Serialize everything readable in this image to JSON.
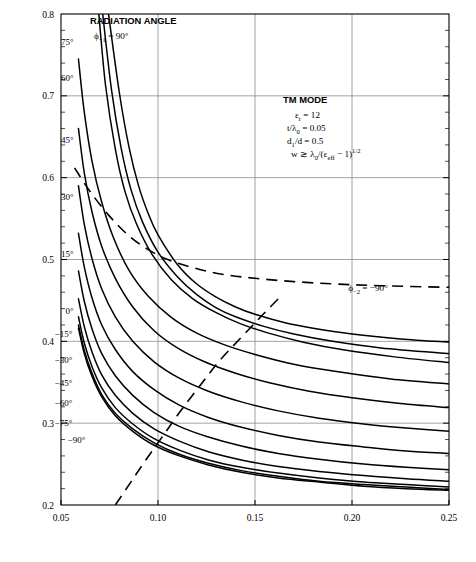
{
  "figure": {
    "background": "#ffffff",
    "frame_color": "#000000",
    "grid_color": "#8c8c8c",
    "curve_color": "#000000"
  },
  "chart_data": {
    "type": "line",
    "title": "",
    "xlabel": "ANTENNA HEIGHT (h/λ₀)—WAVELENGTHS",
    "ylabel": "CORRUGATION PERIOD (d/λ₀)—WAVELENGTHS",
    "xlim": [
      0.05,
      0.25
    ],
    "ylim": [
      0.2,
      0.8
    ],
    "xticks": [
      0.05,
      0.1,
      0.15,
      0.2,
      0.25
    ],
    "xtick_labels": [
      "0.05",
      "0.10",
      "0.15",
      "0.20",
      "0.25"
    ],
    "yticks": [
      0.2,
      0.3,
      0.4,
      0.5,
      0.6,
      0.7,
      0.8
    ],
    "ytick_labels": [
      "0.2",
      "0.3",
      "0.4",
      "0.5",
      "0.6",
      "0.7",
      "0.8"
    ],
    "y_minor_step": 0.02,
    "grid": true,
    "grid_major_only": true,
    "legend_position": "inline-curve-labels",
    "annotations": {
      "header": "RADIATION ANGLE",
      "header_sub": "ϕ₋₁ = 90°",
      "mode_title": "TM MODE",
      "params": [
        "εᵣ = 12",
        "t/λ₀ = 0.05",
        "d₁/d = 0.5",
        "w ≳ λ₀/(ε_eff − 1)^(1/2)"
      ],
      "dashed_curve_label": "ϕ₋₂ = −90°"
    },
    "series": [
      {
        "name": "75°",
        "label": "75°",
        "style": "solid",
        "label_xy": [
          0.0565,
          0.762
        ],
        "points": [
          [
            0.0745,
            0.8
          ],
          [
            0.08,
            0.705
          ],
          [
            0.085,
            0.638
          ],
          [
            0.09,
            0.59
          ],
          [
            0.095,
            0.556
          ],
          [
            0.1,
            0.53
          ],
          [
            0.11,
            0.494
          ],
          [
            0.12,
            0.47
          ],
          [
            0.13,
            0.454
          ],
          [
            0.14,
            0.442
          ],
          [
            0.15,
            0.433
          ],
          [
            0.165,
            0.423
          ],
          [
            0.18,
            0.416
          ],
          [
            0.2,
            0.409
          ],
          [
            0.225,
            0.403
          ],
          [
            0.25,
            0.399
          ]
        ]
      },
      {
        "name": "60°",
        "label": "60°",
        "style": "solid",
        "label_xy": [
          0.0565,
          0.718
        ],
        "points": [
          [
            0.0715,
            0.8
          ],
          [
            0.076,
            0.708
          ],
          [
            0.081,
            0.636
          ],
          [
            0.086,
            0.586
          ],
          [
            0.092,
            0.546
          ],
          [
            0.1,
            0.509
          ],
          [
            0.11,
            0.479
          ],
          [
            0.12,
            0.457
          ],
          [
            0.13,
            0.441
          ],
          [
            0.14,
            0.43
          ],
          [
            0.155,
            0.418
          ],
          [
            0.17,
            0.409
          ],
          [
            0.19,
            0.4
          ],
          [
            0.215,
            0.392
          ],
          [
            0.25,
            0.385
          ]
        ]
      },
      {
        "name": "45°",
        "label": "45°",
        "style": "solid",
        "label_xy": [
          0.0565,
          0.642
        ],
        "points": [
          [
            0.0695,
            0.8
          ],
          [
            0.073,
            0.712
          ],
          [
            0.078,
            0.635
          ],
          [
            0.083,
            0.583
          ],
          [
            0.089,
            0.543
          ],
          [
            0.097,
            0.506
          ],
          [
            0.107,
            0.475
          ],
          [
            0.118,
            0.452
          ],
          [
            0.13,
            0.435
          ],
          [
            0.142,
            0.422
          ],
          [
            0.157,
            0.41
          ],
          [
            0.175,
            0.399
          ],
          [
            0.197,
            0.389
          ],
          [
            0.222,
            0.381
          ],
          [
            0.25,
            0.374
          ]
        ]
      },
      {
        "name": "30°",
        "label": "30°",
        "style": "solid",
        "label_xy": [
          0.0565,
          0.573
        ],
        "points": [
          [
            0.059,
            0.745
          ],
          [
            0.062,
            0.68
          ],
          [
            0.066,
            0.62
          ],
          [
            0.071,
            0.57
          ],
          [
            0.077,
            0.527
          ],
          [
            0.085,
            0.487
          ],
          [
            0.095,
            0.455
          ],
          [
            0.107,
            0.429
          ],
          [
            0.12,
            0.41
          ],
          [
            0.134,
            0.396
          ],
          [
            0.15,
            0.384
          ],
          [
            0.17,
            0.372
          ],
          [
            0.192,
            0.363
          ],
          [
            0.22,
            0.354
          ],
          [
            0.25,
            0.348
          ]
        ]
      },
      {
        "name": "15°",
        "label": "15°",
        "style": "solid",
        "label_xy": [
          0.0565,
          0.503
        ],
        "points": [
          [
            0.059,
            0.66
          ],
          [
            0.062,
            0.606
          ],
          [
            0.066,
            0.558
          ],
          [
            0.071,
            0.516
          ],
          [
            0.078,
            0.477
          ],
          [
            0.087,
            0.442
          ],
          [
            0.098,
            0.413
          ],
          [
            0.11,
            0.392
          ],
          [
            0.124,
            0.375
          ],
          [
            0.14,
            0.361
          ],
          [
            0.158,
            0.349
          ],
          [
            0.178,
            0.339
          ],
          [
            0.2,
            0.331
          ],
          [
            0.225,
            0.324
          ],
          [
            0.25,
            0.319
          ]
        ]
      },
      {
        "name": "0°",
        "label": "0°",
        "style": "solid",
        "label_xy": [
          0.0565,
          0.434
        ],
        "points": [
          [
            0.059,
            0.59
          ],
          [
            0.062,
            0.543
          ],
          [
            0.066,
            0.501
          ],
          [
            0.071,
            0.464
          ],
          [
            0.078,
            0.43
          ],
          [
            0.087,
            0.4
          ],
          [
            0.098,
            0.375
          ],
          [
            0.111,
            0.355
          ],
          [
            0.126,
            0.339
          ],
          [
            0.143,
            0.326
          ],
          [
            0.162,
            0.315
          ],
          [
            0.183,
            0.306
          ],
          [
            0.206,
            0.299
          ],
          [
            0.228,
            0.294
          ],
          [
            0.25,
            0.29
          ]
        ]
      },
      {
        "name": "-15°",
        "label": "−15°",
        "style": "solid",
        "label_xy": [
          0.0558,
          0.405
        ],
        "points": [
          [
            0.059,
            0.532
          ],
          [
            0.062,
            0.491
          ],
          [
            0.066,
            0.453
          ],
          [
            0.071,
            0.42
          ],
          [
            0.078,
            0.39
          ],
          [
            0.087,
            0.363
          ],
          [
            0.098,
            0.341
          ],
          [
            0.111,
            0.322
          ],
          [
            0.126,
            0.307
          ],
          [
            0.143,
            0.295
          ],
          [
            0.162,
            0.285
          ],
          [
            0.183,
            0.277
          ],
          [
            0.206,
            0.271
          ],
          [
            0.228,
            0.266
          ],
          [
            0.25,
            0.263
          ]
        ]
      },
      {
        "name": "-30°",
        "label": "−30°",
        "style": "solid",
        "label_xy": [
          0.0558,
          0.374
        ],
        "points": [
          [
            0.059,
            0.486
          ],
          [
            0.062,
            0.449
          ],
          [
            0.066,
            0.415
          ],
          [
            0.071,
            0.385
          ],
          [
            0.078,
            0.358
          ],
          [
            0.087,
            0.334
          ],
          [
            0.098,
            0.313
          ],
          [
            0.111,
            0.296
          ],
          [
            0.126,
            0.283
          ],
          [
            0.143,
            0.272
          ],
          [
            0.162,
            0.263
          ],
          [
            0.183,
            0.256
          ],
          [
            0.206,
            0.25
          ],
          [
            0.228,
            0.246
          ],
          [
            0.25,
            0.243
          ]
        ]
      },
      {
        "name": "-45°",
        "label": "−45°",
        "style": "solid",
        "label_xy": [
          0.0558,
          0.345
        ],
        "points": [
          [
            0.059,
            0.452
          ],
          [
            0.062,
            0.418
          ],
          [
            0.066,
            0.387
          ],
          [
            0.071,
            0.359
          ],
          [
            0.078,
            0.334
          ],
          [
            0.087,
            0.312
          ],
          [
            0.098,
            0.293
          ],
          [
            0.111,
            0.278
          ],
          [
            0.126,
            0.265
          ],
          [
            0.143,
            0.255
          ],
          [
            0.162,
            0.247
          ],
          [
            0.183,
            0.241
          ],
          [
            0.206,
            0.236
          ],
          [
            0.228,
            0.232
          ],
          [
            0.25,
            0.229
          ]
        ]
      },
      {
        "name": "-60°",
        "label": "−60°",
        "style": "solid",
        "label_xy": [
          0.0558,
          0.321
        ],
        "points": [
          [
            0.059,
            0.43
          ],
          [
            0.062,
            0.398
          ],
          [
            0.066,
            0.369
          ],
          [
            0.071,
            0.343
          ],
          [
            0.078,
            0.319
          ],
          [
            0.087,
            0.299
          ],
          [
            0.098,
            0.281
          ],
          [
            0.111,
            0.267
          ],
          [
            0.126,
            0.255
          ],
          [
            0.143,
            0.246
          ],
          [
            0.162,
            0.239
          ],
          [
            0.183,
            0.233
          ],
          [
            0.206,
            0.228
          ],
          [
            0.228,
            0.225
          ],
          [
            0.25,
            0.222
          ]
        ]
      },
      {
        "name": "-75°",
        "label": "−75°",
        "style": "solid",
        "label_xy": [
          0.0558,
          0.297
        ],
        "points": [
          [
            0.059,
            0.42
          ],
          [
            0.062,
            0.389
          ],
          [
            0.066,
            0.361
          ],
          [
            0.071,
            0.335
          ],
          [
            0.078,
            0.312
          ],
          [
            0.087,
            0.293
          ],
          [
            0.098,
            0.276
          ],
          [
            0.111,
            0.262
          ],
          [
            0.126,
            0.251
          ],
          [
            0.143,
            0.242
          ],
          [
            0.162,
            0.235
          ],
          [
            0.183,
            0.229
          ],
          [
            0.206,
            0.225
          ],
          [
            0.228,
            0.222
          ],
          [
            0.25,
            0.219
          ]
        ]
      },
      {
        "name": "-90°",
        "label": "−90°",
        "style": "solid",
        "label_xy": [
          0.0625,
          0.276
        ],
        "points": [
          [
            0.059,
            0.416
          ],
          [
            0.062,
            0.385
          ],
          [
            0.066,
            0.357
          ],
          [
            0.071,
            0.332
          ],
          [
            0.078,
            0.309
          ],
          [
            0.087,
            0.29
          ],
          [
            0.098,
            0.273
          ],
          [
            0.111,
            0.26
          ],
          [
            0.126,
            0.249
          ],
          [
            0.143,
            0.24
          ],
          [
            0.162,
            0.233
          ],
          [
            0.183,
            0.228
          ],
          [
            0.206,
            0.223
          ],
          [
            0.228,
            0.22
          ],
          [
            0.25,
            0.218
          ]
        ]
      }
    ],
    "dashed_series": [
      {
        "name": "phi-minus-2-equals-minus-90",
        "label": "ϕ₋₂ = −90°",
        "style": "dashed",
        "label_xy": [
          0.193,
          0.487
        ],
        "points": [
          [
            0.057,
            0.612
          ],
          [
            0.065,
            0.583
          ],
          [
            0.075,
            0.553
          ],
          [
            0.085,
            0.529
          ],
          [
            0.095,
            0.512
          ],
          [
            0.105,
            0.5
          ],
          [
            0.118,
            0.49
          ],
          [
            0.133,
            0.482
          ],
          [
            0.15,
            0.477
          ],
          [
            0.17,
            0.473
          ],
          [
            0.192,
            0.47
          ],
          [
            0.215,
            0.468
          ],
          [
            0.25,
            0.466
          ]
        ]
      },
      {
        "name": "leaky-wave-boundary",
        "label": "",
        "style": "dashed",
        "label_xy": null,
        "points": [
          [
            0.078,
            0.2
          ],
          [
            0.086,
            0.228
          ],
          [
            0.094,
            0.256
          ],
          [
            0.103,
            0.286
          ],
          [
            0.112,
            0.316
          ],
          [
            0.122,
            0.347
          ],
          [
            0.132,
            0.377
          ],
          [
            0.143,
            0.405
          ],
          [
            0.153,
            0.43
          ],
          [
            0.162,
            0.452
          ]
        ]
      }
    ]
  }
}
